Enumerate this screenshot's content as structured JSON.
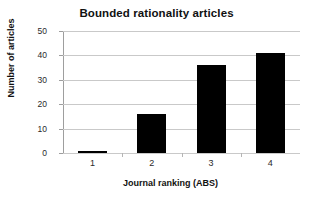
{
  "chart_data": {
    "type": "bar",
    "title": "Bounded rationality articles",
    "xlabel": "Journal ranking (ABS)",
    "ylabel": "Number of articles",
    "categories": [
      "1",
      "2",
      "3",
      "4"
    ],
    "values": [
      1,
      16,
      36,
      41
    ],
    "ylim": [
      0,
      50
    ],
    "yticks": [
      0,
      10,
      20,
      30,
      40,
      50
    ],
    "ytick_labels": [
      "0",
      "10",
      "20",
      "30",
      "40",
      "50"
    ],
    "grid": "horizontal",
    "legend": "none",
    "bar_color": "#000000",
    "gridline_color": "#c9c9c9",
    "background_color": "#ffffff"
  }
}
